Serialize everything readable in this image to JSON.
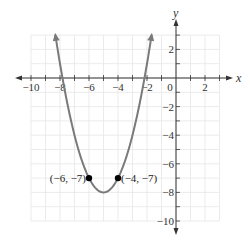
{
  "chart_data": {
    "type": "line",
    "title": "",
    "xlabel": "x",
    "ylabel": "y",
    "xlim": [
      -10,
      3
    ],
    "ylim": [
      -10,
      3
    ],
    "grid": true,
    "x_ticks": [
      -10,
      -8,
      -6,
      -4,
      -2,
      0,
      2
    ],
    "y_ticks": [
      2,
      -2,
      -4,
      -6,
      -8,
      -10
    ],
    "x_tick_labels": [
      "−10",
      "−8",
      "−6",
      "−4",
      "−2",
      "0",
      "2"
    ],
    "y_tick_labels": [
      "2",
      "−2",
      "−4",
      "−6",
      "−8",
      "−10"
    ],
    "series": [
      {
        "name": "parabola",
        "equation": "y = (x + 5)^2 - 8",
        "vertex": [
          -5,
          -8
        ],
        "x_range": [
          -8.32,
          -1.68
        ],
        "color": "#7a7a7a"
      }
    ],
    "points": [
      {
        "x": -6,
        "y": -7,
        "label": "(−6, −7)"
      },
      {
        "x": -4,
        "y": -7,
        "label": "(−4, −7)"
      }
    ]
  },
  "colors": {
    "grid": "#e6e6e6",
    "axis": "#333333",
    "curve": "#7a7a7a",
    "point": "#000000"
  }
}
